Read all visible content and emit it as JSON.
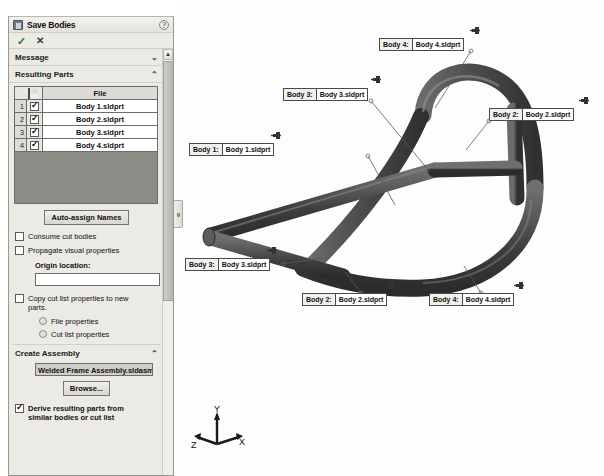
{
  "panel": {
    "title": "Save Bodies",
    "doc_icon": "part-document-icon",
    "help_icon": "help-icon",
    "ok_glyph": "✓",
    "ok_name": "ok-button",
    "cancel_glyph": "✕",
    "cancel_name": "cancel-button",
    "sections": {
      "message": {
        "label": "Message",
        "chevron": "⌄"
      },
      "resulting_parts": {
        "label": "Resulting Parts",
        "chevron": "⌃"
      },
      "create_assembly": {
        "label": "Create Assembly",
        "chevron": "⌃"
      }
    },
    "table": {
      "header_icon": "save-icon",
      "header_file": "File",
      "rows": [
        {
          "num": "1",
          "checked": true,
          "file": "Body 1.sldprt"
        },
        {
          "num": "2",
          "checked": true,
          "file": "Body 2.sldprt"
        },
        {
          "num": "3",
          "checked": true,
          "file": "Body 3.sldprt"
        },
        {
          "num": "4",
          "checked": true,
          "file": "Body 4.sldprt"
        }
      ]
    },
    "auto_assign_label": "Auto-assign Names",
    "consume_cut_bodies": {
      "label": "Consume cut bodies",
      "checked": false
    },
    "propagate_visual": {
      "label": "Propagate visual properties",
      "checked": false
    },
    "origin_location_label": "Origin location:",
    "origin_location_value": "",
    "copy_cut_list": {
      "label": "Copy cut list  properties to new parts.",
      "checked": false
    },
    "radio_file_properties": {
      "label": "File properties",
      "selected": false
    },
    "radio_cut_list_properties": {
      "label": "Cut list properties",
      "selected": false
    },
    "assembly_name": "Welded Frame Assembly.sldasm",
    "browse_label": "Browse...",
    "derive_parts": {
      "label": "Derive resulting parts from similar bodies or cut list",
      "checked": true
    }
  },
  "graphics": {
    "triad": {
      "x_label": "X",
      "y_label": "Y",
      "z_label": "Z"
    },
    "model_color": "#4a4a4a",
    "callouts": [
      {
        "id": "c1",
        "body": "Body  4:",
        "file": "Body 4.sldprt",
        "x": 196,
        "y": 38,
        "pin_x": 287,
        "pin_y": 26
      },
      {
        "id": "c2",
        "body": "Body  3:",
        "file": "Body 3.sldprt",
        "x": 100,
        "y": 88,
        "pin_x": 188,
        "pin_y": 75
      },
      {
        "id": "c3",
        "body": "Body  2:",
        "file": "Body 2.sldprt",
        "x": 306,
        "y": 108,
        "pin_x": 396,
        "pin_y": 96
      },
      {
        "id": "c4",
        "body": "Body  1:",
        "file": "Body 1.sldprt",
        "x": 6,
        "y": 143,
        "pin_x": 88,
        "pin_y": 131
      },
      {
        "id": "c5",
        "body": "Body  3:",
        "file": "Body 3.sldprt",
        "x": 2,
        "y": 258,
        "pin_x": 84,
        "pin_y": 246
      },
      {
        "id": "c6",
        "body": "Body  2:",
        "file": "Body 2.sldprt",
        "x": 119,
        "y": 293,
        "pin_x": 201,
        "pin_y": 281
      },
      {
        "id": "c7",
        "body": "Body  4:",
        "file": "Body 4.sldprt",
        "x": 246,
        "y": 293,
        "pin_x": 331,
        "pin_y": 281
      }
    ]
  }
}
